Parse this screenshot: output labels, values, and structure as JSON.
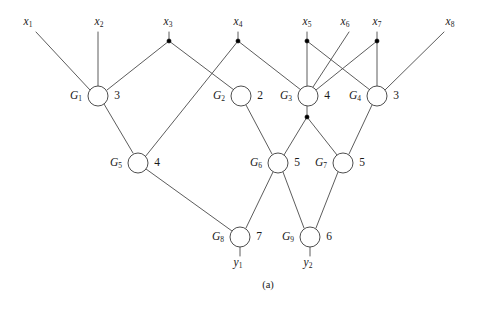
{
  "figure": {
    "caption": "(a)",
    "type": "combinational-logic-circuit-graph",
    "colors": {
      "background": "#ffffff",
      "wire": "#4a4a4a",
      "node_stroke": "#3a3a3a",
      "node_fill": "#ffffff",
      "fanout_dot": "#000000",
      "text": "#1a1a1a"
    }
  },
  "inputs": [
    {
      "id": "x1",
      "name": "x",
      "sub": "1",
      "x": 28,
      "y": 22,
      "terminal_x": 36,
      "terminal_y": 32,
      "has_fanout_dot": false
    },
    {
      "id": "x2",
      "name": "x",
      "sub": "2",
      "x": 99,
      "y": 22,
      "terminal_x": 98,
      "terminal_y": 32,
      "has_fanout_dot": false
    },
    {
      "id": "x3",
      "name": "x",
      "sub": "3",
      "x": 168,
      "y": 22,
      "terminal_x": 169,
      "terminal_y": 41,
      "has_fanout_dot": true
    },
    {
      "id": "x4",
      "name": "x",
      "sub": "4",
      "x": 238,
      "y": 22,
      "terminal_x": 238,
      "terminal_y": 41,
      "has_fanout_dot": true
    },
    {
      "id": "x5",
      "name": "x",
      "sub": "5",
      "x": 307,
      "y": 22,
      "terminal_x": 307,
      "terminal_y": 41,
      "has_fanout_dot": true
    },
    {
      "id": "x6",
      "name": "x",
      "sub": "6",
      "x": 345,
      "y": 22,
      "terminal_x": 349,
      "terminal_y": 32,
      "has_fanout_dot": false
    },
    {
      "id": "x7",
      "name": "x",
      "sub": "7",
      "x": 377,
      "y": 22,
      "terminal_x": 377,
      "terminal_y": 41,
      "has_fanout_dot": true
    },
    {
      "id": "x8",
      "name": "x",
      "sub": "8",
      "x": 450,
      "y": 22,
      "terminal_x": 444,
      "terminal_y": 32,
      "has_fanout_dot": false
    }
  ],
  "outputs": [
    {
      "id": "y1",
      "name": "y",
      "sub": "1",
      "x": 238,
      "y": 263,
      "terminal_x": 240,
      "terminal_y": 254
    },
    {
      "id": "y2",
      "name": "y",
      "sub": "2",
      "x": 308,
      "y": 263,
      "terminal_x": 310,
      "terminal_y": 254
    }
  ],
  "gates": [
    {
      "id": "G1",
      "name": "G",
      "sub": "1",
      "value": "3",
      "cx": 98,
      "cy": 96,
      "r": 10,
      "label_x": 76,
      "label_y": 96,
      "value_x": 117,
      "value_y": 96
    },
    {
      "id": "G2",
      "name": "G",
      "sub": "2",
      "value": "2",
      "cx": 241,
      "cy": 96,
      "r": 10,
      "label_x": 219,
      "label_y": 96,
      "value_x": 260,
      "value_y": 96
    },
    {
      "id": "G3",
      "name": "G",
      "sub": "3",
      "value": "4",
      "cx": 308,
      "cy": 96,
      "r": 10,
      "label_x": 286,
      "label_y": 96,
      "value_x": 327,
      "value_y": 96
    },
    {
      "id": "G4",
      "name": "G",
      "sub": "4",
      "value": "3",
      "cx": 377,
      "cy": 96,
      "r": 10,
      "label_x": 355,
      "label_y": 96,
      "value_x": 396,
      "value_y": 96
    },
    {
      "id": "G5",
      "name": "G",
      "sub": "5",
      "value": "4",
      "cx": 138,
      "cy": 163,
      "r": 10,
      "label_x": 116,
      "label_y": 163,
      "value_x": 157,
      "value_y": 163
    },
    {
      "id": "G6",
      "name": "G",
      "sub": "6",
      "value": "5",
      "cx": 278,
      "cy": 163,
      "r": 10,
      "label_x": 256,
      "label_y": 163,
      "value_x": 297,
      "value_y": 163
    },
    {
      "id": "G7",
      "name": "G",
      "sub": "7",
      "value": "5",
      "cx": 343,
      "cy": 163,
      "r": 10,
      "label_x": 321,
      "label_y": 163,
      "value_x": 362,
      "value_y": 163
    },
    {
      "id": "G8",
      "name": "G",
      "sub": "8",
      "value": "7",
      "cx": 240,
      "cy": 237,
      "r": 10,
      "label_x": 218,
      "label_y": 237,
      "value_x": 259,
      "value_y": 237
    },
    {
      "id": "G9",
      "name": "G",
      "sub": "9",
      "value": "6",
      "cx": 310,
      "cy": 237,
      "r": 10,
      "label_x": 288,
      "label_y": 237,
      "value_x": 329,
      "value_y": 237
    }
  ],
  "fanout_dots": [
    {
      "id": "dot-x3",
      "x": 169,
      "y": 41
    },
    {
      "id": "dot-x4",
      "x": 238,
      "y": 41
    },
    {
      "id": "dot-x5",
      "x": 307,
      "y": 41
    },
    {
      "id": "dot-x7",
      "x": 377,
      "y": 41
    },
    {
      "id": "dot-g3-out",
      "x": 307,
      "y": 117
    }
  ],
  "wires": [
    {
      "id": "w-x1-g1",
      "from": "x1",
      "to": "G1",
      "points": "36,32 90,90"
    },
    {
      "id": "w-x2-g1",
      "from": "x2",
      "to": "G1",
      "points": "98,32 98,86"
    },
    {
      "id": "w-x3-trunk",
      "from": "x3",
      "to": "dot-x3",
      "points": "169,32 169,41"
    },
    {
      "id": "w-x3-g1",
      "from": "dot-x3",
      "to": "G1",
      "points": "169,41 107,90"
    },
    {
      "id": "w-x3-g2",
      "from": "dot-x3",
      "to": "G2",
      "points": "169,41 234,90"
    },
    {
      "id": "w-x4-trunk",
      "from": "x4",
      "to": "dot-x4",
      "points": "238,32 238,41"
    },
    {
      "id": "w-x4-g5",
      "from": "dot-x4",
      "to": "G5",
      "points": "238,41 145,157"
    },
    {
      "id": "w-x4-g3",
      "from": "dot-x4",
      "to": "G3",
      "points": "238,41 301,90"
    },
    {
      "id": "w-x5-trunk",
      "from": "x5",
      "to": "dot-x5",
      "points": "307,32 307,41"
    },
    {
      "id": "w-x5-g3",
      "from": "dot-x5",
      "to": "G3",
      "points": "307,41 307,86"
    },
    {
      "id": "w-x5-g4",
      "from": "dot-x5",
      "to": "G4",
      "points": "307,41 370,90"
    },
    {
      "id": "w-x6-g3",
      "from": "x6",
      "to": "G3",
      "points": "349,32 313,87"
    },
    {
      "id": "w-x7-trunk",
      "from": "x7",
      "to": "dot-x7",
      "points": "377,32 377,41"
    },
    {
      "id": "w-x7-g3",
      "from": "dot-x7",
      "to": "G3",
      "points": "377,41 316,90"
    },
    {
      "id": "w-x7-g4",
      "from": "dot-x7",
      "to": "G4",
      "points": "377,41 377,86"
    },
    {
      "id": "w-x8-g4",
      "from": "x8",
      "to": "G4",
      "points": "444,32 385,90"
    },
    {
      "id": "w-g1-g5",
      "from": "G1",
      "to": "G5",
      "points": "104,104 133,153"
    },
    {
      "id": "w-g2-g6",
      "from": "G2",
      "to": "G6",
      "points": "246,105 272,154"
    },
    {
      "id": "w-g3-trunk",
      "from": "G3",
      "to": "dot-g3-out",
      "points": "307,106 307,117"
    },
    {
      "id": "w-g3-g6",
      "from": "dot-g3-out",
      "to": "G6",
      "points": "307,117 284,155"
    },
    {
      "id": "w-g3-g7",
      "from": "dot-g3-out",
      "to": "G7",
      "points": "307,117 337,155"
    },
    {
      "id": "w-g4-g7",
      "from": "G4",
      "to": "G7",
      "points": "372,105 349,154"
    },
    {
      "id": "w-g5-g8",
      "from": "G5",
      "to": "G8",
      "points": "146,169 232,231"
    },
    {
      "id": "w-g6-g8",
      "from": "G6",
      "to": "G8",
      "points": "273,172 246,228"
    },
    {
      "id": "w-g6-g9",
      "from": "G6",
      "to": "G9",
      "points": "283,172 304,228"
    },
    {
      "id": "w-g7-g9",
      "from": "G7",
      "to": "G9",
      "points": "338,172 316,228"
    },
    {
      "id": "w-g8-y1",
      "from": "G8",
      "to": "y1",
      "points": "240,247 240,256"
    },
    {
      "id": "w-g9-y2",
      "from": "G9",
      "to": "y2",
      "points": "310,247 310,256"
    }
  ],
  "caption": {
    "text": "(a)",
    "x": 268,
    "y": 285
  }
}
